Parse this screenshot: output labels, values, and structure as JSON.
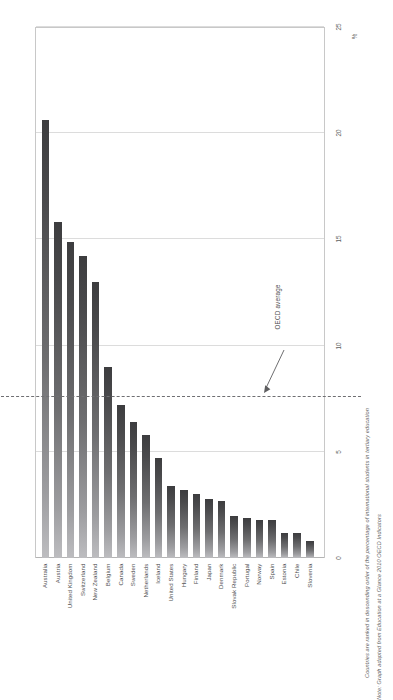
{
  "chart_data": {
    "type": "bar",
    "title": "This chart shows the proportion of international students in tertiary enrolments in each country",
    "xlabel": "",
    "ylabel": "%",
    "ylim": [
      0,
      25
    ],
    "yticks": [
      0,
      5,
      10,
      15,
      20,
      25
    ],
    "grid": true,
    "legend": "none",
    "orientation": "vertical",
    "categories": [
      "Australia",
      "Austria",
      "United Kingdom",
      "Switzerland",
      "New Zealand",
      "Belgium",
      "Canada",
      "Sweden",
      "Netherlands",
      "Iceland",
      "United States",
      "Hungary",
      "Finland",
      "Japan",
      "Denmark",
      "Slovak Republic",
      "Portugal",
      "Norway",
      "Spain",
      "Estonia",
      "Chile",
      "Slovenia"
    ],
    "values": [
      20.6,
      15.8,
      14.9,
      14.2,
      13.0,
      9.0,
      7.2,
      6.4,
      5.8,
      4.7,
      3.4,
      3.2,
      3.0,
      2.8,
      2.7,
      2.0,
      1.9,
      1.8,
      1.8,
      1.2,
      1.2,
      0.8
    ],
    "annotations": [
      {
        "label": "OECD average",
        "value": 7.6,
        "style": "dashed-reference-line"
      }
    ],
    "bar_color": "#4a4a4c",
    "grid_color": "#dcdcdc",
    "reference_line_color": "#6f6f72"
  },
  "footnotes": {
    "ranking": "Countries are ranked in descending order of the percentage of international students in tertiary education",
    "source": "Note: Graph adapted from Education at a Glance 2010  OECD Indicators"
  }
}
